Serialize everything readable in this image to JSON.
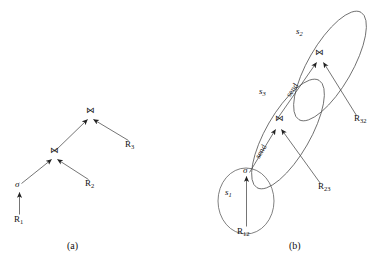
{
  "figure": {
    "panel_a": {
      "caption": "(a)",
      "nodes": {
        "root_join": "⋈",
        "inner_join": "⋈",
        "select": "σ",
        "leaf_r1": "R",
        "leaf_r1_sub": "1",
        "leaf_r2": "R",
        "leaf_r2_sub": "2",
        "leaf_r3": "R",
        "leaf_r3_sub": "3"
      }
    },
    "panel_b": {
      "caption": "(b)",
      "sites": {
        "s1": "s",
        "s1_sub": "1",
        "s2": "s",
        "s2_sub": "2",
        "s3": "s",
        "s3_sub": "3"
      },
      "nodes": {
        "select": "σ",
        "join_s3": "⋈",
        "join_s2": "⋈",
        "rel_r12": "R",
        "rel_r12_sub": "12",
        "rel_r23": "R",
        "rel_r23_sub": "23",
        "rel_r32": "R",
        "rel_r32_sub": "32"
      },
      "edges": {
        "send_lower": "send",
        "send_upper": "send"
      }
    }
  },
  "colors": {
    "stroke": "#3a3a3a",
    "ellipse_stroke": "#555555",
    "text": "#111111",
    "background": "#ffffff"
  }
}
